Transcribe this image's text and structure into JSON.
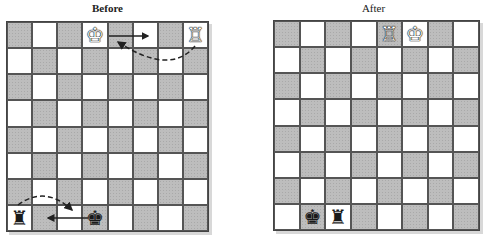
{
  "before": {
    "title": "Before",
    "pieces": [
      {
        "square": "d8",
        "type": "king",
        "color": "white",
        "glyph": "♔"
      },
      {
        "square": "h8",
        "type": "rook",
        "color": "white",
        "glyph": "♖"
      },
      {
        "square": "a1",
        "type": "rook",
        "color": "black",
        "glyph": "♜"
      },
      {
        "square": "d1",
        "type": "king",
        "color": "black",
        "glyph": "♚"
      }
    ],
    "arrows": [
      {
        "from": "d8",
        "to": "f8",
        "style": "solid",
        "meaning": "king moves two squares toward rook"
      },
      {
        "from": "h8",
        "to": "e8",
        "style": "dashed-curve",
        "meaning": "rook jumps over king"
      },
      {
        "from": "d1",
        "to": "b1",
        "style": "solid",
        "meaning": "king moves two squares toward rook"
      },
      {
        "from": "a1",
        "to": "c1",
        "style": "dashed-curve",
        "meaning": "rook jumps over king"
      }
    ]
  },
  "after": {
    "title": "After",
    "pieces": [
      {
        "square": "e8",
        "type": "rook",
        "color": "white",
        "glyph": "♖"
      },
      {
        "square": "f8",
        "type": "king",
        "color": "white",
        "glyph": "♔"
      },
      {
        "square": "b1",
        "type": "king",
        "color": "black",
        "glyph": "♚"
      },
      {
        "square": "c1",
        "type": "rook",
        "color": "black",
        "glyph": "♜"
      }
    ]
  },
  "colors": {
    "dark_square": "#bdbdbd",
    "light_square": "#ffffff",
    "grid_line": "#444444"
  }
}
